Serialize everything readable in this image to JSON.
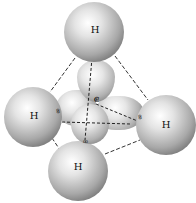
{
  "diagram": {
    "atoms": {
      "top": {
        "label": "H"
      },
      "left": {
        "label": "H"
      },
      "right": {
        "label": "H"
      },
      "bottom": {
        "label": "H"
      },
      "center": {
        "label": "C"
      }
    },
    "electron_pair_glyph": "oo",
    "colors": {
      "sphere_highlight": "#ffffff",
      "sphere_shadow": "#3d3d3d",
      "edge_line": "#333333",
      "background": "#ffffff"
    }
  }
}
